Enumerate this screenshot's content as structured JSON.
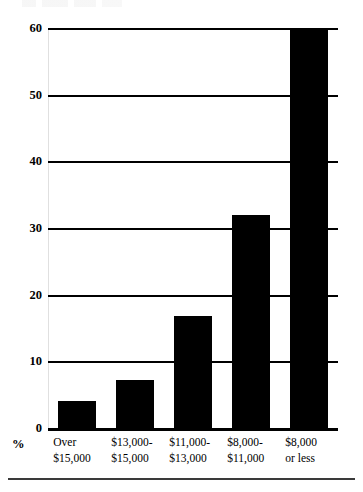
{
  "chart_data": {
    "type": "bar",
    "title": "",
    "subtitle": "",
    "xlabel": "",
    "ylabel": "%",
    "ylim": [
      0,
      60
    ],
    "yticks": [
      0,
      10,
      20,
      30,
      40,
      50,
      60
    ],
    "ytick_labels": [
      "0",
      "10",
      "20",
      "30",
      "40",
      "50",
      "60"
    ],
    "grid": true,
    "legend": null,
    "bar_color": "#000000",
    "categories": [
      "Over $15,000",
      "$13,000-$15,000",
      "$11,000-$13,000",
      "$8,000-$11,000",
      "$8,000 or less"
    ],
    "category_lines": [
      [
        "Over",
        "$15,000"
      ],
      [
        "$13,000-",
        "$15,000"
      ],
      [
        "$11,000-",
        "$13,000"
      ],
      [
        "$8,000-",
        "$11,000"
      ],
      [
        "$8,000",
        "or less"
      ]
    ],
    "values": [
      4,
      7.2,
      16.8,
      32,
      60
    ]
  },
  "axis": {
    "percent_symbol": "%"
  }
}
